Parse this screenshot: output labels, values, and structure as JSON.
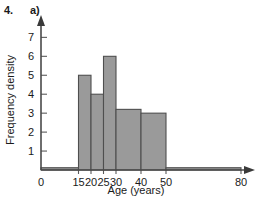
{
  "header": {
    "question_number": "4.",
    "part_label": "a)"
  },
  "chart_data": {
    "type": "bar",
    "title": "",
    "subtitle": "",
    "xlabel": "Age (years)",
    "ylabel": "Frequency density",
    "grid": false,
    "legend": null,
    "xlim": [
      0,
      80
    ],
    "ylim": [
      0,
      7.6
    ],
    "x_ticks": [
      0,
      15,
      20,
      25,
      30,
      40,
      50,
      80
    ],
    "x_tick_labels": [
      "0",
      "15",
      "20",
      "25",
      "30",
      "40",
      "50",
      "80"
    ],
    "y_ticks": [
      1,
      2,
      3,
      4,
      5,
      6,
      7
    ],
    "y_tick_labels": [
      "1",
      "2",
      "3",
      "4",
      "5",
      "6",
      "7"
    ],
    "bar_fill_color": "#9a9a9a",
    "bar_edge_color": "#4f4f4f",
    "axis_color": "#4a4a4a",
    "bins": [
      {
        "label": "0-15",
        "x_start": 0,
        "x_end": 15,
        "value": 0.12
      },
      {
        "label": "15-20",
        "x_start": 15,
        "x_end": 20,
        "value": 5
      },
      {
        "label": "20-25",
        "x_start": 20,
        "x_end": 25,
        "value": 4
      },
      {
        "label": "25-30",
        "x_start": 25,
        "x_end": 30,
        "value": 6
      },
      {
        "label": "30-40",
        "x_start": 30,
        "x_end": 40,
        "value": 3.2
      },
      {
        "label": "40-50",
        "x_start": 40,
        "x_end": 50,
        "value": 3
      },
      {
        "label": "50-80",
        "x_start": 50,
        "x_end": 80,
        "value": 0.12
      }
    ]
  }
}
